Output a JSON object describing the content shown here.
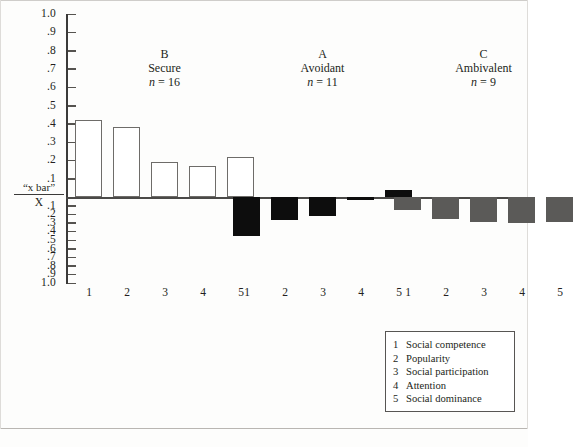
{
  "chart_data": {
    "type": "bar",
    "title": "",
    "xlabel": "",
    "ylabel": "“x bar” / X",
    "ylim": [
      -1.0,
      1.0
    ],
    "grid": false,
    "legend_position": "bottom-right",
    "zero_label_top": "“x bar”",
    "zero_label_bottom": "X",
    "y_ticks_positive": [
      "1.0",
      ".9",
      ".8",
      ".7",
      ".6",
      ".5",
      ".4",
      ".3",
      ".2",
      ".1"
    ],
    "y_ticks_negative": [
      ".1",
      ".2",
      ".3",
      ".4",
      ".5",
      ".6",
      ".7",
      ".8",
      ".9",
      "1.0"
    ],
    "categories": [
      "1",
      "2",
      "3",
      "4",
      "5"
    ],
    "groups": [
      {
        "code": "B",
        "name": "Secure",
        "n_label": "n = 16",
        "n": 16,
        "color": "#ffffff",
        "values": [
          0.42,
          0.38,
          0.19,
          0.17,
          0.22
        ]
      },
      {
        "code": "A",
        "name": "Avoidant",
        "n_label": "n = 11",
        "n": 11,
        "color": "#0d0d0d",
        "values": [
          -0.45,
          -0.27,
          -0.22,
          -0.04,
          0.04
        ]
      },
      {
        "code": "C",
        "name": "Ambivalent",
        "n_label": "n = 9",
        "n": 9,
        "color": "#5b5a58",
        "values": [
          -0.15,
          -0.26,
          -0.29,
          -0.3,
          -0.29
        ]
      }
    ],
    "legend": [
      {
        "key": "1",
        "label": "Social competence"
      },
      {
        "key": "2",
        "label": "Popularity"
      },
      {
        "key": "3",
        "label": "Social participation"
      },
      {
        "key": "4",
        "label": "Attention"
      },
      {
        "key": "5",
        "label": "Social dominance"
      }
    ]
  }
}
